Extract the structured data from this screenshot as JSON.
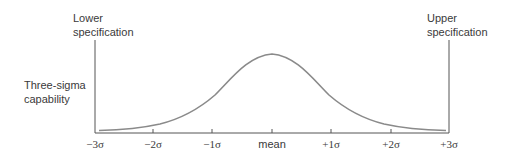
{
  "diagram": {
    "lower_spec": {
      "line1": "Lower",
      "line2": "specification"
    },
    "upper_spec": {
      "line1": "Upper",
      "line2": "specification"
    },
    "capability": {
      "line1": "Three-sigma",
      "line2": "capability"
    },
    "axis_ticks": [
      {
        "label": "−3σ",
        "x": 95
      },
      {
        "label": "−2σ",
        "x": 153
      },
      {
        "label": "−1σ",
        "x": 212
      },
      {
        "label": "mean",
        "x": 272
      },
      {
        "label": "+1σ",
        "x": 331
      },
      {
        "label": "+2σ",
        "x": 391
      },
      {
        "label": "+3σ",
        "x": 449
      }
    ],
    "colors": {
      "text": "#3a3a3a",
      "curve": "#8a8a8a",
      "axis": "#555555"
    }
  }
}
